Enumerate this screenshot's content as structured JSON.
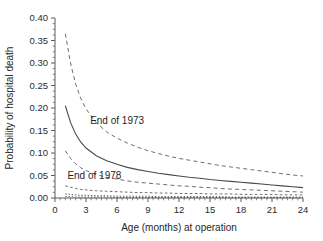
{
  "chart_data": {
    "type": "line",
    "title": "",
    "xlabel": "Age (months) at operation",
    "ylabel": "Probability of hospital death",
    "xlim": [
      0,
      24
    ],
    "ylim": [
      0.0,
      0.4
    ],
    "grid": false,
    "legend_position": "in-plot annotations",
    "x_ticks": [
      "0",
      "3",
      "6",
      "9",
      "12",
      "15",
      "18",
      "21",
      "24"
    ],
    "x_tick_values": [
      0,
      3,
      6,
      9,
      12,
      15,
      18,
      21,
      24
    ],
    "y_ticks": [
      "0.00",
      "0.05",
      "0.10",
      "0.15",
      "0.20",
      "0.25",
      "0.30",
      "0.35",
      "0.40"
    ],
    "y_tick_values": [
      0.0,
      0.05,
      0.1,
      0.15,
      0.2,
      0.25,
      0.3,
      0.35,
      0.4
    ],
    "annotations": [
      {
        "text": "End of 1973",
        "x": 3.4,
        "y": 0.165
      },
      {
        "text": "End of 1978",
        "x": 1.2,
        "y": 0.043
      }
    ],
    "x": [
      1,
      1.5,
      2,
      2.5,
      3,
      4,
      5,
      6,
      7,
      8,
      9,
      10,
      11,
      12,
      13,
      14,
      15,
      16,
      17,
      18,
      19,
      20,
      21,
      22,
      23,
      24
    ],
    "series": [
      {
        "name": "End of 1973 upper 95% limit",
        "style": "dashed",
        "values": [
          0.365,
          0.3,
          0.253,
          0.221,
          0.198,
          0.167,
          0.147,
          0.133,
          0.122,
          0.113,
          0.105,
          0.099,
          0.093,
          0.088,
          0.084,
          0.08,
          0.076,
          0.072,
          0.069,
          0.066,
          0.063,
          0.06,
          0.057,
          0.054,
          0.051,
          0.049
        ]
      },
      {
        "name": "End of 1973 estimate",
        "style": "solid",
        "values": [
          0.205,
          0.168,
          0.142,
          0.124,
          0.111,
          0.094,
          0.083,
          0.075,
          0.068,
          0.063,
          0.059,
          0.055,
          0.052,
          0.049,
          0.046,
          0.044,
          0.041,
          0.039,
          0.037,
          0.035,
          0.033,
          0.031,
          0.029,
          0.027,
          0.025,
          0.023
        ]
      },
      {
        "name": "End of 1973 lower 95% limit",
        "style": "dashed",
        "values": [
          0.105,
          0.088,
          0.076,
          0.067,
          0.061,
          0.052,
          0.046,
          0.042,
          0.038,
          0.035,
          0.033,
          0.031,
          0.029,
          0.027,
          0.026,
          0.024,
          0.023,
          0.021,
          0.02,
          0.019,
          0.018,
          0.017,
          0.016,
          0.015,
          0.014,
          0.013
        ]
      },
      {
        "name": "End of 1978 upper 95% limit",
        "style": "dashed-fine",
        "values": [
          0.027,
          0.024,
          0.021,
          0.019,
          0.018,
          0.016,
          0.015,
          0.014,
          0.013,
          0.012,
          0.012,
          0.011,
          0.011,
          0.01,
          0.01,
          0.01,
          0.009,
          0.009,
          0.009,
          0.008,
          0.008,
          0.008,
          0.008,
          0.007,
          0.007,
          0.007
        ]
      },
      {
        "name": "End of 1978 estimate",
        "style": "dotted",
        "values": [
          0.009,
          0.008,
          0.007,
          0.006,
          0.006,
          0.005,
          0.005,
          0.004,
          0.004,
          0.004,
          0.004,
          0.003,
          0.003,
          0.003,
          0.003,
          0.003,
          0.003,
          0.003,
          0.002,
          0.002,
          0.002,
          0.002,
          0.002,
          0.002,
          0.002,
          0.002
        ]
      },
      {
        "name": "End of 1978 lower 95% limit",
        "style": "dotted",
        "values": [
          0.003,
          0.003,
          0.002,
          0.002,
          0.002,
          0.002,
          0.002,
          0.001,
          0.001,
          0.001,
          0.001,
          0.001,
          0.001,
          0.001,
          0.001,
          0.001,
          0.001,
          0.001,
          0.001,
          0.001,
          0.001,
          0.001,
          0.001,
          0.001,
          0.001,
          0.001
        ]
      }
    ],
    "colors": {
      "line": "#4a4a4a",
      "dashed": "#6e6e6e",
      "axis": "#5a5a5a",
      "text": "#1f1f1f",
      "background": "#ffffff"
    }
  }
}
